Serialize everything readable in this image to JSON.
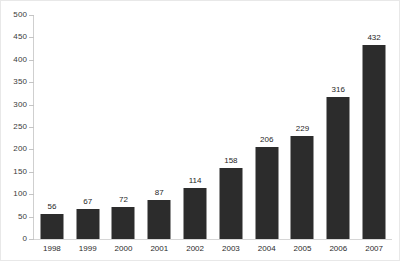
{
  "chart_data": {
    "type": "bar",
    "title": "",
    "subtitle": "",
    "xlabel": "",
    "ylabel": "",
    "categories": [
      "1998",
      "1999",
      "2000",
      "2001",
      "2002",
      "2003",
      "2004",
      "2005",
      "2006",
      "2007"
    ],
    "values": [
      56,
      67,
      72,
      87,
      114,
      158,
      206,
      229,
      316,
      432
    ],
    "data_labels": [
      "56",
      "67",
      "72",
      "87",
      "114",
      "158",
      "206",
      "229",
      "316",
      "432"
    ],
    "ylim": [
      0,
      500
    ],
    "ytick_step": 50,
    "yticks": [
      0,
      50,
      100,
      150,
      200,
      250,
      300,
      350,
      400,
      450,
      500
    ],
    "ytick_labels": [
      "0",
      "50",
      "100",
      "150",
      "200",
      "250",
      "300",
      "350",
      "400",
      "450",
      "500"
    ],
    "grid": false,
    "legend": null,
    "legend_position": "none",
    "bar_color": "#2c2c2c",
    "axis_color": "#cfcfcf",
    "background_color": "#ffffff",
    "label_color": "#1f1f1f"
  }
}
